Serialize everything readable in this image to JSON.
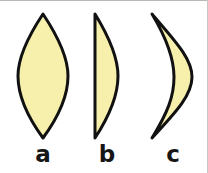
{
  "figure": {
    "background_color": "#ffffff",
    "width": 208,
    "height": 173
  },
  "style": {
    "fill_color": "#F6F0AC",
    "stroke_color": "#111111",
    "stroke_width": 3,
    "label_color": "#161616",
    "border_color": "#b9b9b4"
  },
  "shapes": [
    {
      "id": "shape-a",
      "label": "a",
      "name": "lens-shape-biconvex",
      "description": "symmetric pointed lens, convex on both left and right sides",
      "path": "M 43 14 C 23 44, 18 62, 18 76 C 18 92, 24 112, 43 138 C 62 112, 68 92, 68 76 C 68 62, 63 44, 43 14 Z",
      "bounds": {
        "x": 18,
        "y": 14,
        "width": 50,
        "height": 124
      }
    },
    {
      "id": "shape-b",
      "label": "b",
      "name": "half-lens-shape-plano-convex",
      "description": "flat straight left edge with a single convex bulge on the right",
      "path": "M 95 14 L 95 138 C 112 112, 118 92, 118 76 C 118 60, 111 40, 95 14 Z",
      "bounds": {
        "x": 95,
        "y": 14,
        "width": 23,
        "height": 124
      }
    },
    {
      "id": "shape-c",
      "label": "c",
      "name": "crescent-shape-concave-convex",
      "description": "crescent with concave left edge and convex right edge, tips at top and bottom left",
      "path": "M 152 14 C 174 40, 192 58, 192 77 C 192 96, 174 114, 152 138 C 168 112, 174 96, 174 77 C 174 58, 167 39, 152 14 Z",
      "bounds": {
        "x": 152,
        "y": 14,
        "width": 40,
        "height": 124
      }
    }
  ],
  "labels": {
    "a": "a",
    "b": "b",
    "c": "c"
  }
}
